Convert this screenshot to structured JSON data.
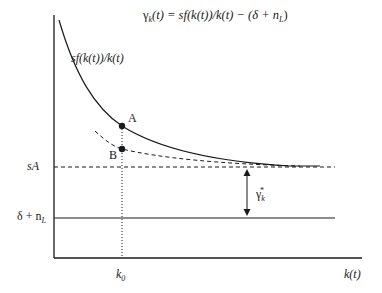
{
  "diagram": {
    "equation": {
      "gamma": "γ",
      "gamma_sub": "k",
      "rest": "(t) = sf(k(t))/k(t) − (δ + n",
      "n_sub": "L",
      "close": ")"
    },
    "curve_label": "sf(k(t))/k(t)",
    "points": {
      "a": "A",
      "b": "B"
    },
    "y_labels": {
      "sA": "sA",
      "delta_n_prefix": "δ + n",
      "delta_n_sub": "L"
    },
    "gap_label": {
      "gamma": "γ",
      "sub": "k",
      "sup": "*"
    },
    "x_labels": {
      "k0_base": "k",
      "k0_sub": "0",
      "x_axis": "k(t)"
    },
    "colors": {
      "line": "#1a1a1a",
      "background": "#ffffff"
    }
  }
}
